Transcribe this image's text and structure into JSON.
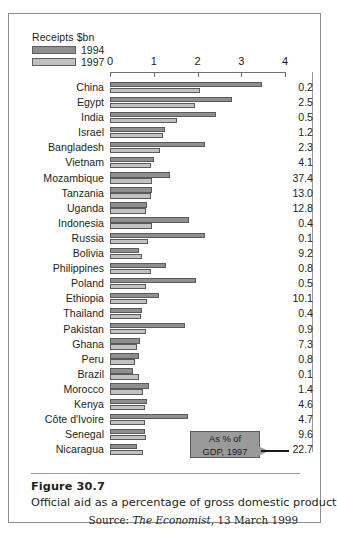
{
  "legend": {
    "title": "Receipts $bn",
    "items": [
      {
        "label": "1994",
        "color": "#8f8f8f"
      },
      {
        "label": "1997",
        "color": "#c0c0c0"
      }
    ]
  },
  "callout": {
    "line1": "As % of",
    "line2": "GDP, 1997"
  },
  "figure": {
    "number": "Figure 30.7",
    "description": "Official aid as a percentage of gross domestic product",
    "source_prefix": "Source: ",
    "source_name": "The Economist",
    "source_suffix": ", 13 March 1999"
  },
  "chart_data": {
    "type": "bar",
    "orientation": "horizontal",
    "title": "Official aid as a percentage of gross domestic product",
    "xlabel": "Receipts $bn",
    "ylabel": "",
    "xlim": [
      0,
      4
    ],
    "xticks": [
      "0",
      "1",
      "2",
      "3",
      "4"
    ],
    "grid": false,
    "legend_position": "top-left",
    "categories": [
      "China",
      "Egypt",
      "India",
      "Israel",
      "Bangladesh",
      "Vietnam",
      "Mozambique",
      "Tanzania",
      "Uganda",
      "Indonesia",
      "Russia",
      "Bolivia",
      "Philippines",
      "Poland",
      "Ethiopia",
      "Thailand",
      "Pakistan",
      "Ghana",
      "Peru",
      "Brazil",
      "Morocco",
      "Kenya",
      "Côte d'Ivoire",
      "Senegal",
      "Nicaragua"
    ],
    "series": [
      {
        "name": "1994",
        "color": "#8f8f8f",
        "values": [
          3.47,
          2.78,
          2.43,
          1.26,
          2.17,
          1.0,
          1.37,
          0.96,
          0.85,
          1.8,
          2.18,
          0.67,
          1.28,
          1.97,
          1.13,
          0.72,
          1.72,
          0.69,
          0.66,
          0.53,
          0.88,
          0.84,
          1.78,
          0.8,
          0.62
        ]
      },
      {
        "name": "1997",
        "color": "#c2c2c2",
        "values": [
          2.06,
          1.95,
          1.53,
          1.22,
          1.15,
          0.94,
          0.95,
          0.94,
          0.83,
          0.96,
          0.86,
          0.74,
          0.93,
          0.83,
          0.84,
          0.71,
          0.82,
          0.61,
          0.58,
          0.66,
          0.76,
          0.79,
          0.79,
          0.83,
          0.75
        ]
      }
    ],
    "secondary_axis": {
      "label": "As % of GDP, 1997",
      "values": [
        "0.2",
        "2.5",
        "0.5",
        "1.2",
        "2.3",
        "4.1",
        "37.4",
        "13.0",
        "12.8",
        "0.4",
        "0.1",
        "9.2",
        "0.8",
        "0.5",
        "10.1",
        "0.4",
        "0.9",
        "7.3",
        "0.8",
        "0.1",
        "1.4",
        "4.6",
        "4.7",
        "9.6",
        "22.7"
      ]
    }
  }
}
